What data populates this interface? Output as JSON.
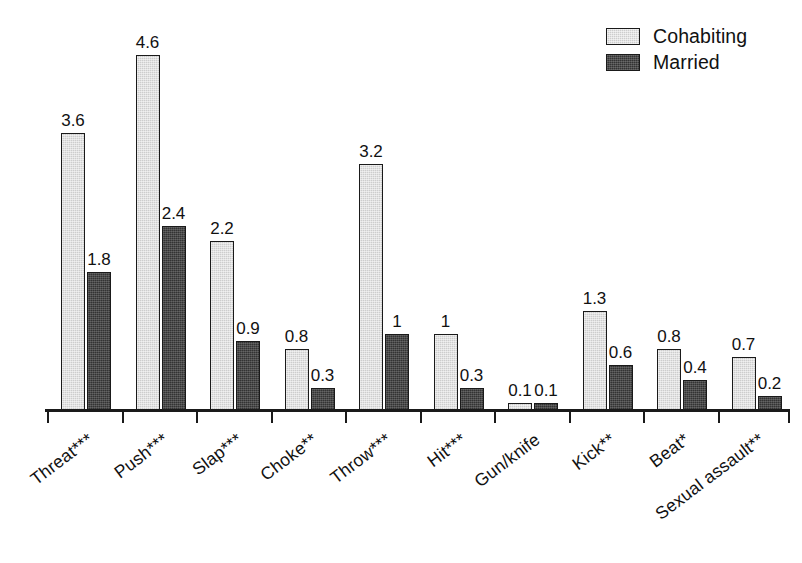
{
  "chart_data": {
    "type": "bar",
    "title": "",
    "subtitle": "",
    "xlabel": "",
    "ylabel": "",
    "ylim": [
      0,
      4.8
    ],
    "grid": false,
    "legend_position": "top-right",
    "categories": [
      "Threat***",
      "Push***",
      "Slap***",
      "Choke**",
      "Throw***",
      "Hit***",
      "Gun/knife",
      "Kick**",
      "Beat*",
      "Sexual assault**"
    ],
    "series": [
      {
        "name": "Cohabiting",
        "color": "#cdcdcd",
        "values": [
          3.6,
          4.6,
          2.2,
          0.8,
          3.2,
          1,
          0.1,
          1.3,
          0.8,
          0.7
        ],
        "labels": [
          "3.6",
          "4.6",
          "2.2",
          "0.8",
          "3.2",
          "1",
          "0.1",
          "1.3",
          "0.8",
          "0.7"
        ]
      },
      {
        "name": "Married",
        "color": "#333333",
        "values": [
          1.8,
          2.4,
          0.9,
          0.3,
          1,
          0.3,
          0.1,
          0.6,
          0.4,
          0.2
        ],
        "labels": [
          "1.8",
          "2.4",
          "0.9",
          "0.3",
          "1",
          "0.3",
          "0.1",
          "0.6",
          "0.4",
          "0.2"
        ]
      }
    ]
  },
  "legend": {
    "items": [
      {
        "label": "Cohabiting",
        "swatch": "cohabiting"
      },
      {
        "label": "Married",
        "swatch": "married"
      }
    ]
  },
  "colors": {
    "cohabiting": "#cdcdcd",
    "married": "#333333",
    "axis": "#1a1a1a",
    "text": "#111111",
    "background": "#ffffff"
  }
}
